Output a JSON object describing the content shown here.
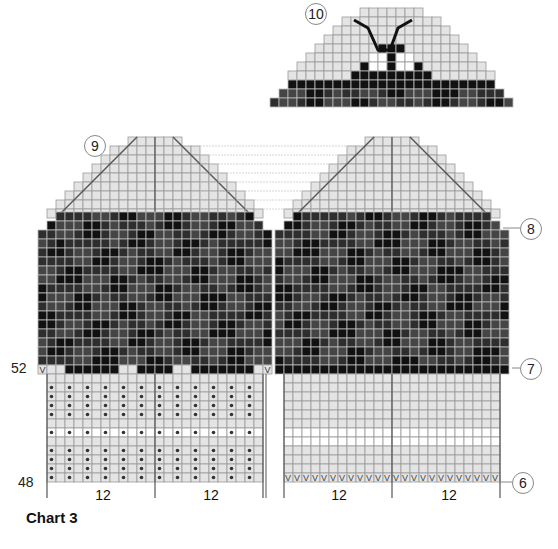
{
  "title": "Chart 3",
  "labels": {
    "circle_10": "10",
    "circle_9": "9",
    "circle_8": "8",
    "circle_7": "7",
    "circle_6": "6",
    "row_52": "52",
    "row_48": "48"
  },
  "repeats": [
    "12",
    "12",
    "12",
    "12"
  ],
  "colors": {
    "dark": "#1a1a1a",
    "mid_dark": "#3a3a3a",
    "light": "#e4e4e4",
    "white": "#ffffff",
    "grid_light": "#9a9a9a",
    "grid_dark": "#bbbbbb",
    "dot": "#333333"
  },
  "symbols": {
    "v": "V",
    "dot": "•"
  }
}
